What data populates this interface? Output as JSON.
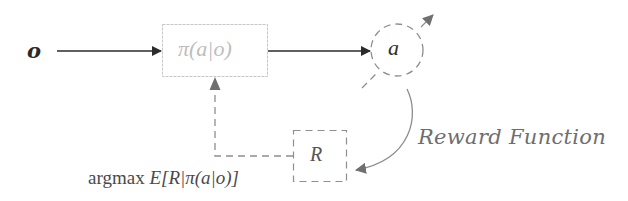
{
  "diagram": {
    "type": "reinforcement-learning-policy-loop",
    "nodes": {
      "observation": {
        "label": "o"
      },
      "policy": {
        "label": "π(a|o)"
      },
      "action": {
        "label": "a"
      },
      "reward": {
        "label": "R"
      }
    },
    "annotations": {
      "objective": {
        "prefix": "argmax ",
        "expectation": "E",
        "body": "[R|π(a|o)]"
      },
      "reward_function": "Reward Function"
    },
    "edges": [
      {
        "from": "observation",
        "to": "policy",
        "style": "solid"
      },
      {
        "from": "policy",
        "to": "action",
        "style": "solid"
      },
      {
        "from": "action",
        "to": "reward",
        "style": "curved-solid",
        "label": "Reward Function"
      },
      {
        "from": "reward",
        "to": "policy",
        "style": "dashed",
        "label": "argmax E[R|π(a|o)]"
      },
      {
        "from": "action",
        "to": "outside",
        "style": "dashed-diagonal"
      }
    ],
    "colors": {
      "solid_arrow": "#2b2b2b",
      "dashed": "#8a8a8a",
      "policy_box": "#c8c8c8",
      "policy_text": "#bdbdbd",
      "reward_curve": "#8c8c8c"
    }
  }
}
